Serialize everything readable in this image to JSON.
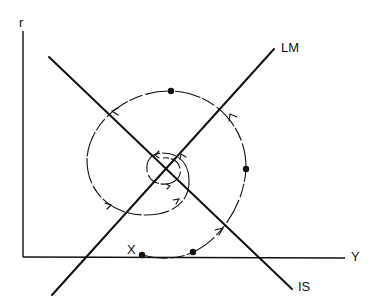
{
  "diagram": {
    "type": "IS-LM phase diagram",
    "axes": {
      "y_label": "r",
      "x_label": "Y"
    },
    "curves": [
      {
        "name": "IS",
        "label": "IS",
        "slope": "negative"
      },
      {
        "name": "LM",
        "label": "LM",
        "slope": "positive"
      }
    ],
    "path": {
      "start_label": "X",
      "description": "counter-clockwise spiral converging to IS-LM intersection",
      "direction_arrows": 8,
      "marked_points": 4
    },
    "colors": {
      "ink": "#111111",
      "background": "#ffffff"
    }
  }
}
